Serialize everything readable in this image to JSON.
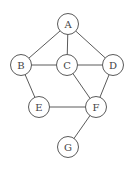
{
  "graph": {
    "type": "undirected",
    "nodes": [
      {
        "id": "A",
        "label": "A"
      },
      {
        "id": "B",
        "label": "B"
      },
      {
        "id": "C",
        "label": "C"
      },
      {
        "id": "D",
        "label": "D"
      },
      {
        "id": "E",
        "label": "E"
      },
      {
        "id": "F",
        "label": "F"
      },
      {
        "id": "G",
        "label": "G"
      }
    ],
    "edges": [
      [
        "A",
        "B"
      ],
      [
        "A",
        "C"
      ],
      [
        "A",
        "D"
      ],
      [
        "B",
        "C"
      ],
      [
        "C",
        "D"
      ],
      [
        "B",
        "E"
      ],
      [
        "C",
        "F"
      ],
      [
        "D",
        "F"
      ],
      [
        "E",
        "F"
      ],
      [
        "F",
        "G"
      ]
    ]
  },
  "colors": {
    "stroke": "#5a5a5a",
    "label": "#444444",
    "background": "#ffffff"
  }
}
